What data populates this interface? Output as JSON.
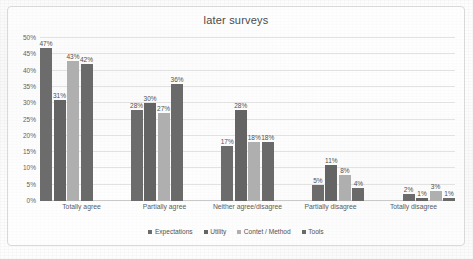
{
  "chart_data": {
    "type": "bar",
    "title": "later surveys",
    "xlabel": "",
    "ylabel": "",
    "ylim": [
      0,
      50
    ],
    "grid": true,
    "legend_position": "bottom",
    "value_suffix": "%",
    "categories": [
      "Totally agree",
      "Partially agree",
      "Neither agree/disagree",
      "Partially disagree",
      "Totally disagree"
    ],
    "ytick_labels": [
      "0%",
      "5%",
      "10%",
      "15%",
      "20%",
      "25%",
      "30%",
      "35%",
      "40%",
      "45%",
      "50%"
    ],
    "ytick_values": [
      0,
      5,
      10,
      15,
      20,
      25,
      30,
      35,
      40,
      45,
      50
    ],
    "series": [
      {
        "name": "Expectations",
        "color": "#6c6c6c",
        "values": [
          47,
          28,
          17,
          5,
          2
        ],
        "labels": [
          "47%",
          "28%",
          "17%",
          "5%",
          "2%"
        ]
      },
      {
        "name": "Utility",
        "color": "#646464",
        "values": [
          31,
          30,
          28,
          11,
          1
        ],
        "labels": [
          "31%",
          "30%",
          "28%",
          "11%",
          "1%"
        ]
      },
      {
        "name": "Contet / Method",
        "color": "#afafaf",
        "values": [
          43,
          27,
          18,
          8,
          3
        ],
        "labels": [
          "43%",
          "27%",
          "18%",
          "8%",
          "3%"
        ]
      },
      {
        "name": "Tools",
        "color": "#6a6a6a",
        "values": [
          42,
          36,
          18,
          4,
          1
        ],
        "labels": [
          "42%",
          "36%",
          "18%",
          "4%",
          "1%"
        ]
      }
    ]
  }
}
